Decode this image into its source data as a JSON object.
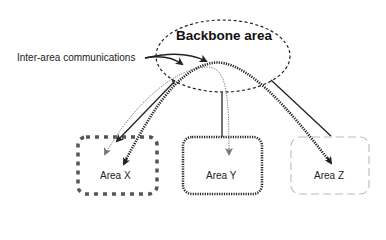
{
  "diagram": {
    "backbone": {
      "label": "Backbone area"
    },
    "annotation": {
      "label": "Inter-area communications"
    },
    "areas": [
      {
        "id": "x",
        "label": "Area X",
        "border": "thick-dashed"
      },
      {
        "id": "y",
        "label": "Area Y",
        "border": "dotted"
      },
      {
        "id": "z",
        "label": "Area Z",
        "border": "light-dashed"
      }
    ],
    "colors": {
      "line": "#222222",
      "light_dash": "#bbbbbb",
      "dot_arrow": "#777777"
    }
  }
}
